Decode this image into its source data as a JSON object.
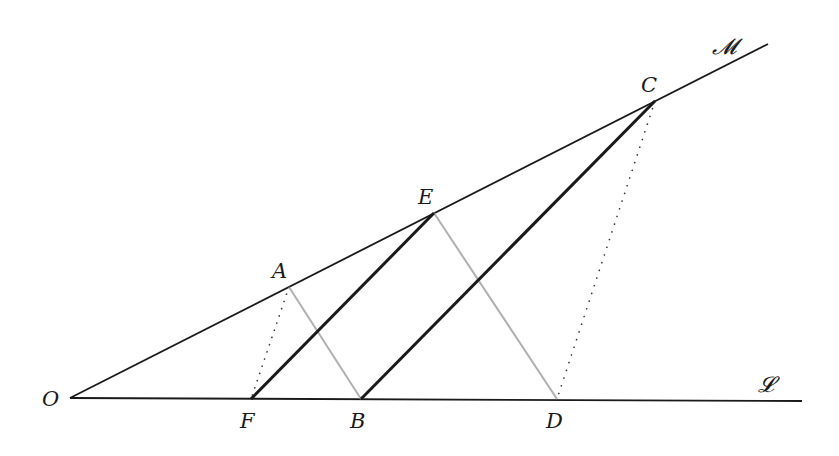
{
  "diagram": {
    "type": "geometric-construction",
    "points": {
      "O": {
        "label": "O",
        "x": 70,
        "y": 398,
        "lx": 42,
        "ly": 406
      },
      "F": {
        "label": "F",
        "x": 251,
        "y": 399,
        "lx": 240,
        "ly": 428
      },
      "B": {
        "label": "B",
        "x": 361,
        "y": 399,
        "lx": 350,
        "ly": 428
      },
      "D": {
        "label": "D",
        "x": 557,
        "y": 399,
        "lx": 546,
        "ly": 428
      },
      "A": {
        "label": "A",
        "x": 289,
        "y": 287,
        "lx": 272,
        "ly": 278
      },
      "E": {
        "label": "E",
        "x": 434,
        "y": 213,
        "lx": 418,
        "ly": 204
      },
      "C": {
        "label": "C",
        "x": 655,
        "y": 101,
        "lx": 641,
        "ly": 92
      }
    },
    "lines": {
      "M": {
        "label": "𝓜",
        "x1": 70,
        "y1": 398,
        "x2": 768,
        "y2": 44,
        "lx": 712,
        "ly": 54
      },
      "L": {
        "label": "𝓛",
        "x1": 70,
        "y1": 398,
        "x2": 802,
        "y2": 401,
        "lx": 758,
        "ly": 392
      }
    },
    "segments": [
      {
        "name": "FE",
        "from": "F",
        "to": "E",
        "style": "thick",
        "color": "#1a1a1a"
      },
      {
        "name": "BC",
        "from": "B",
        "to": "C",
        "style": "thick",
        "color": "#1a1a1a"
      },
      {
        "name": "AB",
        "from": "A",
        "to": "B",
        "style": "gray",
        "color": "#b0b0b0"
      },
      {
        "name": "ED",
        "from": "E",
        "to": "D",
        "style": "gray",
        "color": "#b0b0b0"
      },
      {
        "name": "AF",
        "from": "A",
        "to": "F",
        "style": "dotted",
        "color": "#333333"
      },
      {
        "name": "CD",
        "from": "C",
        "to": "D",
        "style": "dotted",
        "color": "#333333"
      }
    ]
  }
}
